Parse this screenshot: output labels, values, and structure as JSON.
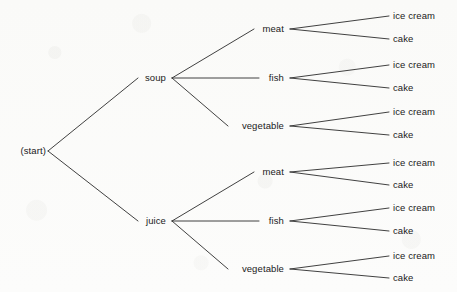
{
  "diagram": {
    "type": "tree",
    "background_color": "#fbfbfa",
    "line_color": "#2b2b2b",
    "text_color": "#1a1a1a",
    "root": {
      "id": "start",
      "label": "(start)",
      "x": 46,
      "y": 151,
      "anchor": "right"
    },
    "level1": [
      {
        "id": "soup",
        "label": "soup",
        "x": 166,
        "y": 78,
        "anchor": "right"
      },
      {
        "id": "juice",
        "label": "juice",
        "x": 166,
        "y": 221,
        "anchor": "right"
      }
    ],
    "level2": [
      {
        "id": "soup-meat",
        "label": "meat",
        "x": 284,
        "y": 29,
        "anchor": "right"
      },
      {
        "id": "soup-fish",
        "label": "fish",
        "x": 284,
        "y": 78,
        "anchor": "right"
      },
      {
        "id": "soup-vegetable",
        "label": "vegetable",
        "x": 284,
        "y": 126,
        "anchor": "right"
      },
      {
        "id": "juice-meat",
        "label": "meat",
        "x": 284,
        "y": 172,
        "anchor": "right"
      },
      {
        "id": "juice-fish",
        "label": "fish",
        "x": 284,
        "y": 221,
        "anchor": "right"
      },
      {
        "id": "juice-vegetable",
        "label": "vegetable",
        "x": 284,
        "y": 269,
        "anchor": "right"
      }
    ],
    "level3": [
      {
        "id": "leaf-1",
        "label": "ice cream",
        "x": 393,
        "y": 16
      },
      {
        "id": "leaf-2",
        "label": "cake",
        "x": 393,
        "y": 39
      },
      {
        "id": "leaf-3",
        "label": "ice cream",
        "x": 393,
        "y": 65
      },
      {
        "id": "leaf-4",
        "label": "cake",
        "x": 393,
        "y": 88
      },
      {
        "id": "leaf-5",
        "label": "ice cream",
        "x": 393,
        "y": 112
      },
      {
        "id": "leaf-6",
        "label": "cake",
        "x": 393,
        "y": 135
      },
      {
        "id": "leaf-7",
        "label": "ice cream",
        "x": 393,
        "y": 163
      },
      {
        "id": "leaf-8",
        "label": "cake",
        "x": 393,
        "y": 185
      },
      {
        "id": "leaf-9",
        "label": "ice cream",
        "x": 393,
        "y": 208
      },
      {
        "id": "leaf-10",
        "label": "cake",
        "x": 393,
        "y": 231
      },
      {
        "id": "leaf-11",
        "label": "ice cream",
        "x": 393,
        "y": 256
      },
      {
        "id": "leaf-12",
        "label": "cake",
        "x": 393,
        "y": 278
      }
    ],
    "edges": [
      {
        "id": "edge-start-soup",
        "from": "start",
        "to": "soup",
        "x1": 48,
        "y1": 151,
        "x2": 138,
        "y2": 78
      },
      {
        "id": "edge-start-juice",
        "from": "start",
        "to": "juice",
        "x1": 48,
        "y1": 151,
        "x2": 138,
        "y2": 221
      },
      {
        "id": "edge-soup-meat",
        "from": "soup",
        "to": "soup-meat",
        "x1": 172,
        "y1": 78,
        "x2": 254,
        "y2": 29
      },
      {
        "id": "edge-soup-fish",
        "from": "soup",
        "to": "soup-fish",
        "x1": 172,
        "y1": 78,
        "x2": 259,
        "y2": 78
      },
      {
        "id": "edge-soup-vegetable",
        "from": "soup",
        "to": "soup-vegetable",
        "x1": 172,
        "y1": 78,
        "x2": 228,
        "y2": 126
      },
      {
        "id": "edge-juice-meat",
        "from": "juice",
        "to": "juice-meat",
        "x1": 172,
        "y1": 221,
        "x2": 254,
        "y2": 172
      },
      {
        "id": "edge-juice-fish",
        "from": "juice",
        "to": "juice-fish",
        "x1": 172,
        "y1": 221,
        "x2": 259,
        "y2": 221
      },
      {
        "id": "edge-juice-vegetable",
        "from": "juice",
        "to": "juice-vegetable",
        "x1": 172,
        "y1": 221,
        "x2": 228,
        "y2": 269
      },
      {
        "id": "edge-soupmeat-ice",
        "from": "soup-meat",
        "to": "leaf-1",
        "x1": 290,
        "y1": 29,
        "x2": 389,
        "y2": 16
      },
      {
        "id": "edge-soupmeat-cake",
        "from": "soup-meat",
        "to": "leaf-2",
        "x1": 290,
        "y1": 29,
        "x2": 389,
        "y2": 39
      },
      {
        "id": "edge-soupfish-ice",
        "from": "soup-fish",
        "to": "leaf-3",
        "x1": 290,
        "y1": 78,
        "x2": 389,
        "y2": 65
      },
      {
        "id": "edge-soupfish-cake",
        "from": "soup-fish",
        "to": "leaf-4",
        "x1": 290,
        "y1": 78,
        "x2": 389,
        "y2": 88
      },
      {
        "id": "edge-soupveg-ice",
        "from": "soup-vegetable",
        "to": "leaf-5",
        "x1": 290,
        "y1": 126,
        "x2": 389,
        "y2": 112
      },
      {
        "id": "edge-soupveg-cake",
        "from": "soup-vegetable",
        "to": "leaf-6",
        "x1": 290,
        "y1": 126,
        "x2": 389,
        "y2": 135
      },
      {
        "id": "edge-juicemeat-ice",
        "from": "juice-meat",
        "to": "leaf-7",
        "x1": 290,
        "y1": 172,
        "x2": 389,
        "y2": 163
      },
      {
        "id": "edge-juicemeat-cake",
        "from": "juice-meat",
        "to": "leaf-8",
        "x1": 290,
        "y1": 172,
        "x2": 389,
        "y2": 185
      },
      {
        "id": "edge-juicefish-ice",
        "from": "juice-fish",
        "to": "leaf-9",
        "x1": 290,
        "y1": 221,
        "x2": 389,
        "y2": 208
      },
      {
        "id": "edge-juicefish-cake",
        "from": "juice-fish",
        "to": "leaf-10",
        "x1": 290,
        "y1": 221,
        "x2": 389,
        "y2": 231
      },
      {
        "id": "edge-juiceveg-ice",
        "from": "juice-vegetable",
        "to": "leaf-11",
        "x1": 290,
        "y1": 269,
        "x2": 389,
        "y2": 256
      },
      {
        "id": "edge-juiceveg-cake",
        "from": "juice-vegetable",
        "to": "leaf-12",
        "x1": 290,
        "y1": 269,
        "x2": 389,
        "y2": 278
      }
    ]
  }
}
